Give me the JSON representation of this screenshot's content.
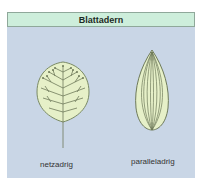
{
  "header": {
    "title": "Blattadern"
  },
  "figures": [
    {
      "id": "netzadrig",
      "label": "netzadrig",
      "shape": "rounded-leaf-with-branching-veins"
    },
    {
      "id": "paralleladrig",
      "label": "paralleladrig",
      "shape": "lanceolate-leaf-with-parallel-veins"
    }
  ],
  "colors": {
    "panel_bg": "#c9d6e6",
    "header_bg": "#cdeedb",
    "leaf_fill": "#e6f0c8",
    "leaf_vein": "#6e7a5a"
  }
}
